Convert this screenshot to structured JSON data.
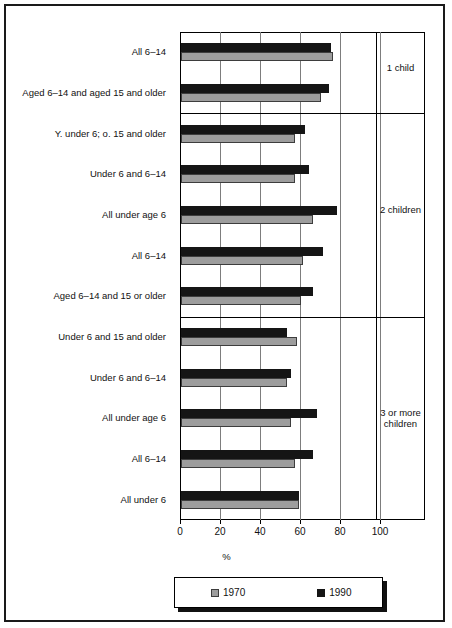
{
  "chart_data": {
    "type": "bar",
    "orientation": "horizontal",
    "title": "",
    "xlabel": "%",
    "ylabel": "",
    "xlim": [
      0,
      100
    ],
    "xticks": [
      0,
      20,
      40,
      60,
      80,
      100
    ],
    "grid": true,
    "legend_position": "bottom",
    "series": [
      {
        "name": "1970",
        "color": "#9d9d9d"
      },
      {
        "name": "1990",
        "color": "#151515"
      }
    ],
    "panels": [
      {
        "label": "1 child",
        "categories": [
          {
            "label": "All 6–14",
            "values": {
              "1970": 76,
              "1990": 75
            }
          },
          {
            "label": "Aged 6–14 and aged 15 and older",
            "values": {
              "1970": 70,
              "1990": 74
            }
          }
        ]
      },
      {
        "label": "2 children",
        "categories": [
          {
            "label": "Y. under 6; o. 15 and older",
            "values": {
              "1970": 57,
              "1990": 62
            }
          },
          {
            "label": "Under 6 and 6–14",
            "values": {
              "1970": 57,
              "1990": 64
            }
          },
          {
            "label": "All under age 6",
            "values": {
              "1970": 66,
              "1990": 78
            }
          },
          {
            "label": "All 6–14",
            "values": {
              "1970": 61,
              "1990": 71
            }
          },
          {
            "label": "Aged 6–14 and 15 or older",
            "values": {
              "1970": 60,
              "1990": 66
            }
          }
        ]
      },
      {
        "label": "3 or more children",
        "categories": [
          {
            "label": "Under 6 and 15 and older",
            "values": {
              "1970": 58,
              "1990": 53
            }
          },
          {
            "label": "Under 6 and 6–14",
            "values": {
              "1970": 53,
              "1990": 55
            }
          },
          {
            "label": "All under age 6",
            "values": {
              "1970": 55,
              "1990": 68
            }
          },
          {
            "label": "All 6–14",
            "values": {
              "1970": 57,
              "1990": 66
            }
          },
          {
            "label": "All under 6",
            "values": {
              "1970": 59,
              "1990": 59
            }
          }
        ]
      }
    ]
  },
  "legend": {
    "items": [
      {
        "label": "1970",
        "swatch": "gray-swatch-icon"
      },
      {
        "label": "1990",
        "swatch": "black-swatch-icon"
      }
    ]
  },
  "axis": {
    "tick_labels": [
      "0",
      "20",
      "40",
      "60",
      "80",
      "100"
    ],
    "x_title": "%"
  }
}
